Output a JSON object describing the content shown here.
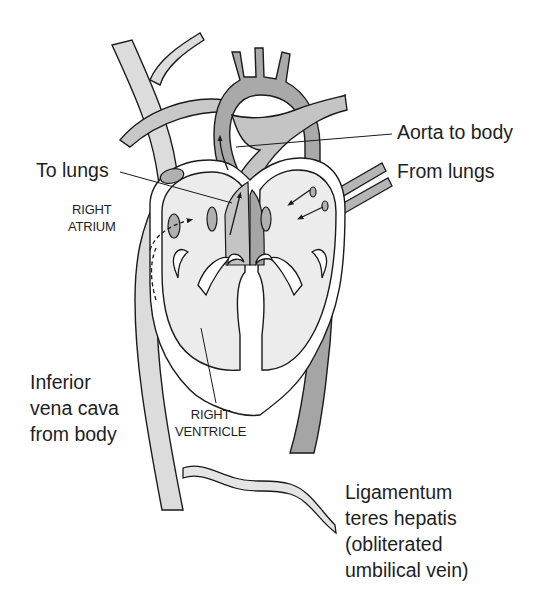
{
  "diagram": {
    "colors": {
      "background": "#ffffff",
      "outline": "#1a1a1a",
      "chamber_fill": "#ececec",
      "vessel_light": "#d6d6d6",
      "vessel_medium": "#bdbdbd",
      "vessel_dark": "#a5a5a5",
      "text": "#1e1e1e"
    },
    "labels": {
      "aorta": "Aorta to body",
      "to_lungs": "To lungs",
      "from_lungs": "From lungs",
      "right_atrium": [
        "RIGHT",
        "ATRIUM"
      ],
      "ivc": [
        "Inferior",
        "vena cava",
        "from body"
      ],
      "right_ventricle": [
        "RIGHT",
        "VENTRICLE"
      ],
      "ligamentum": [
        "Ligamentum",
        "teres hepatis",
        "(obliterated",
        "umbilical vein)"
      ]
    },
    "icons": [
      "flow-arrow",
      "dashed-flow-arrow",
      "valve-opening"
    ]
  }
}
